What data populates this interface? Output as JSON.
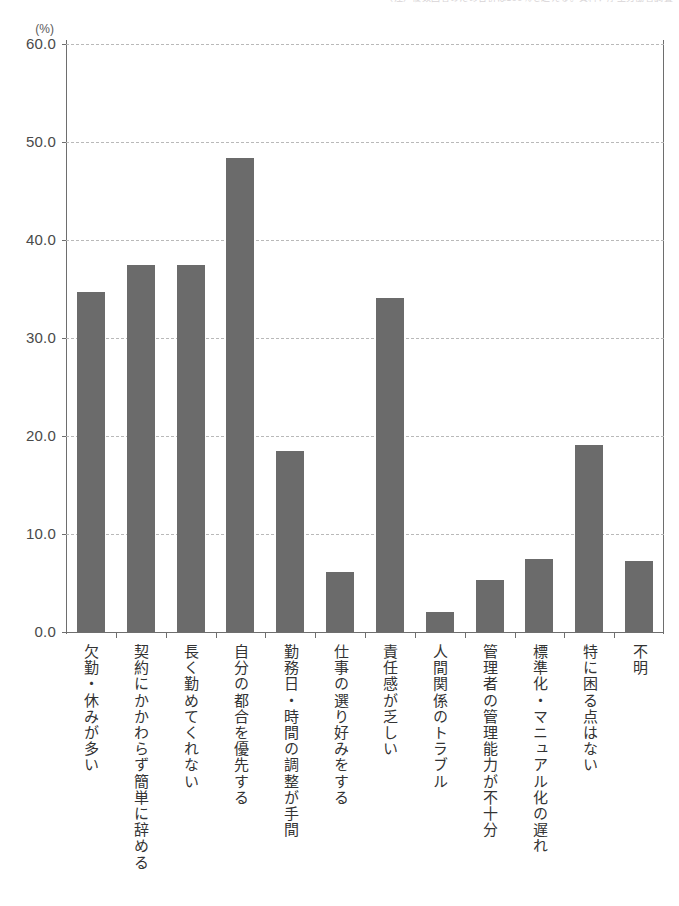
{
  "caption": {
    "text": "（注）複数回答のため合計は100％を超える。資料：厚生労働省調査"
  },
  "chart_data": {
    "type": "bar",
    "title": "",
    "subtitle": "",
    "xlabel": "",
    "ylabel": "(%)",
    "yunit": "(%)",
    "ylim": [
      0.0,
      60.0
    ],
    "ytick_labels": [
      "60.0",
      "50.0",
      "40.0",
      "30.0",
      "20.0",
      "10.0",
      "0.0"
    ],
    "ytick_values": [
      60.0,
      50.0,
      40.0,
      30.0,
      20.0,
      10.0,
      0.0
    ],
    "grid": true,
    "legend": "none",
    "bar_color": "#6b6b6b",
    "categories": [
      "欠勤・休みが多い",
      "契約にかかわらず簡単に辞める",
      "長く勤めてくれない",
      "自分の都合を優先する",
      "勤務日・時間の調整が手間",
      "仕事の選り好みをする",
      "責任感が乏しい",
      "人間関係のトラブル",
      "管理者の管理能力が不十分",
      "標準化・マニュアル化の遅れ",
      "特に困る点はない",
      "不明"
    ],
    "values": [
      34.7,
      37.4,
      37.4,
      48.4,
      18.5,
      6.1,
      34.1,
      2.0,
      5.3,
      7.4,
      19.1,
      7.2
    ]
  }
}
